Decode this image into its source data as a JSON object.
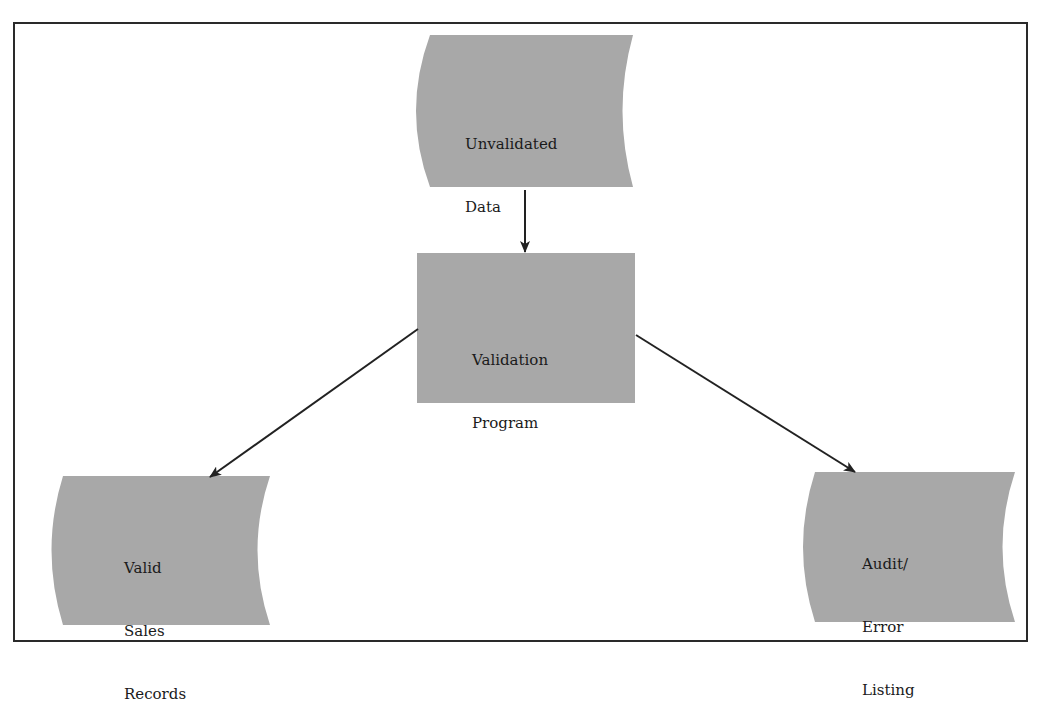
{
  "diagram": {
    "type": "flowchart",
    "nodes": [
      {
        "id": "unvalidated",
        "shape": "stored-data",
        "line1": "Unvalidated",
        "line2": "Data"
      },
      {
        "id": "program",
        "shape": "process",
        "line1": "Validation",
        "line2": "Program"
      },
      {
        "id": "valid",
        "shape": "stored-data",
        "line1": "Valid",
        "line2": "Sales",
        "line3": "Records"
      },
      {
        "id": "audit",
        "shape": "stored-data",
        "line1": "Audit/",
        "line2": "Error",
        "line3": "Listing"
      }
    ],
    "edges": [
      {
        "from": "unvalidated",
        "to": "program"
      },
      {
        "from": "program",
        "to": "valid"
      },
      {
        "from": "program",
        "to": "audit"
      }
    ],
    "colors": {
      "fill": "#a8a8a8",
      "stroke": "#222222",
      "border": "#2a2a2a"
    }
  }
}
